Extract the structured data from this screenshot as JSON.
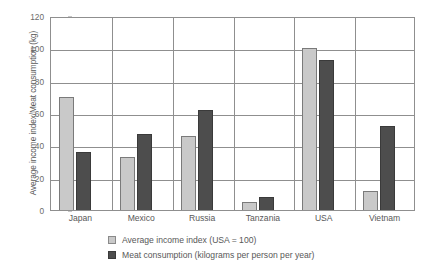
{
  "chart_data": {
    "type": "bar",
    "title": "",
    "xlabel": "",
    "ylabel": "Average income index/Meat consumption (kg)",
    "ylim": [
      0,
      120
    ],
    "yticks": [
      0,
      20,
      40,
      60,
      80,
      100,
      120
    ],
    "grid": true,
    "legend_position": "bottom",
    "categories": [
      "Japan",
      "Mexico",
      "Russia",
      "Tanzania",
      "USA",
      "Vietnam"
    ],
    "series": [
      {
        "name": "Average income index (USA = 100)",
        "color": "#c9c9c9",
        "values": [
          70,
          33,
          46,
          5,
          100,
          12
        ]
      },
      {
        "name": "Meat consumption (kilograms per person per year)",
        "color": "#4d4d4d",
        "values": [
          36,
          47,
          62,
          8,
          93,
          52
        ]
      }
    ]
  },
  "axis": {
    "y_title": "Average income index/Meat consumption (kg)",
    "y_ticks": [
      "0",
      "20",
      "40",
      "60",
      "80",
      "100",
      "120"
    ]
  },
  "legend": {
    "items": [
      {
        "label": "Average income index (USA = 100)",
        "color": "#c9c9c9"
      },
      {
        "label": "Meat consumption (kilograms per person per year)",
        "color": "#4d4d4d"
      }
    ]
  }
}
